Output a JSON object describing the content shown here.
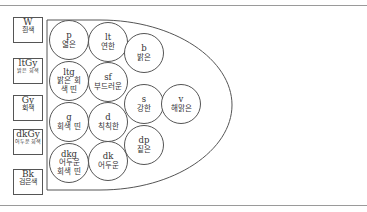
{
  "diagram": {
    "type": "tone-map",
    "achromatic": [
      {
        "code": "W",
        "name": "흰색"
      },
      {
        "code": "ltGy",
        "name": "밝은 회색"
      },
      {
        "code": "Gy",
        "name": "회색"
      },
      {
        "code": "dkGy",
        "name": "어두운 회색"
      },
      {
        "code": "Bk",
        "name": "검은색"
      }
    ],
    "tones": [
      {
        "code": "p",
        "name": "엷은"
      },
      {
        "code": "lt",
        "name": "연한"
      },
      {
        "code": "b",
        "name": "밝은"
      },
      {
        "code": "ltg",
        "name": "밝은 회색 띤"
      },
      {
        "code": "sf",
        "name": "부드러운"
      },
      {
        "code": "s",
        "name": "강한"
      },
      {
        "code": "v",
        "name": "해맑은"
      },
      {
        "code": "g",
        "name": "회색 띤"
      },
      {
        "code": "d",
        "name": "칙칙한"
      },
      {
        "code": "dp",
        "name": "짙은"
      },
      {
        "code": "dkg",
        "name": "어두운 회색 띤"
      },
      {
        "code": "dk",
        "name": "어두운"
      }
    ]
  }
}
